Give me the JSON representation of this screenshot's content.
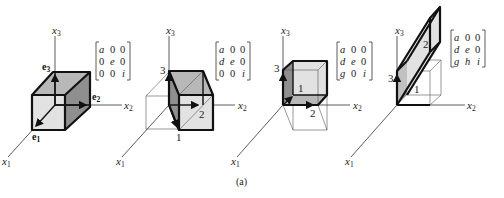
{
  "figure": {
    "caption": "(a)",
    "axes": {
      "x1": "x",
      "x1_sub": "1",
      "x2": "x",
      "x2_sub": "2",
      "x3": "x",
      "x3_sub": "3"
    },
    "panels": [
      {
        "id": "identity-basis",
        "vectors": {
          "e1": "e",
          "e1_sub": "1",
          "e2": "e",
          "e2_sub": "2",
          "e3": "e",
          "e3_sub": "3"
        },
        "matrix": [
          [
            "a",
            "0",
            "0"
          ],
          [
            "0",
            "e",
            "0"
          ],
          [
            "0",
            "0",
            "i"
          ]
        ]
      },
      {
        "id": "shear-d",
        "labels": {
          "l1": "1",
          "l2": "2",
          "l3": "3"
        },
        "matrix": [
          [
            "a",
            "0",
            "0"
          ],
          [
            "d",
            "e",
            "0"
          ],
          [
            "0",
            "0",
            "i"
          ]
        ]
      },
      {
        "id": "shear-dg",
        "labels": {
          "l1": "1",
          "l2": "2",
          "l3": "3"
        },
        "matrix": [
          [
            "a",
            "0",
            "0"
          ],
          [
            "d",
            "e",
            "0"
          ],
          [
            "g",
            "0",
            "i"
          ]
        ]
      },
      {
        "id": "shear-dgh",
        "labels": {
          "l1": "1",
          "l2": "2",
          "l3": "3"
        },
        "matrix": [
          [
            "a",
            "0",
            "0"
          ],
          [
            "d",
            "e",
            "0"
          ],
          [
            "g",
            "h",
            "i"
          ]
        ]
      }
    ]
  }
}
